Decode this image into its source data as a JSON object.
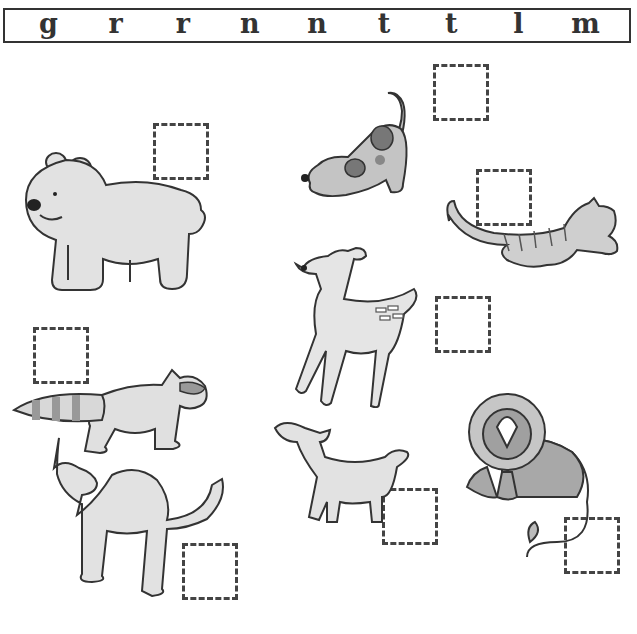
{
  "worksheet": {
    "letter_bank": [
      "g",
      "r",
      "r",
      "n",
      "n",
      "t",
      "t",
      "l",
      "m"
    ],
    "animals": [
      {
        "name": "bear",
        "icon": "bear-icon",
        "box": {
          "x": 153,
          "y": 123,
          "w": 56,
          "h": 57
        }
      },
      {
        "name": "dog",
        "icon": "dog-icon",
        "box": {
          "x": 433,
          "y": 64,
          "w": 56,
          "h": 57
        }
      },
      {
        "name": "cat",
        "icon": "cat-icon",
        "box": {
          "x": 476,
          "y": 169,
          "w": 56,
          "h": 57
        }
      },
      {
        "name": "deer",
        "icon": "deer-icon",
        "box": {
          "x": 435,
          "y": 296,
          "w": 56,
          "h": 57
        }
      },
      {
        "name": "raccoon",
        "icon": "raccoon-icon",
        "box": {
          "x": 33,
          "y": 327,
          "w": 56,
          "h": 57
        }
      },
      {
        "name": "camel",
        "icon": "camel-icon",
        "box": {
          "x": 182,
          "y": 543,
          "w": 56,
          "h": 57
        }
      },
      {
        "name": "lamb",
        "icon": "lamb-icon",
        "box": {
          "x": 382,
          "y": 488,
          "w": 56,
          "h": 57
        }
      },
      {
        "name": "lion",
        "icon": "lion-icon",
        "box": {
          "x": 564,
          "y": 517,
          "w": 56,
          "h": 57
        }
      }
    ],
    "colors": {
      "outline": "#333333",
      "light_fill": "#e2e2e2",
      "mid_fill": "#b8b8b8",
      "dark_fill": "#8a8a8a"
    }
  }
}
